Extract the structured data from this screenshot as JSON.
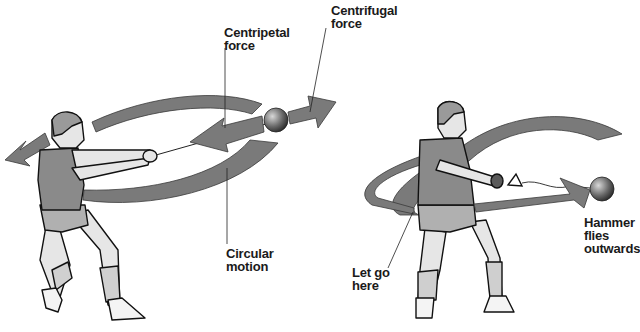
{
  "diagram": {
    "colors": {
      "arrow_fill": "#7a7a7a",
      "arrow_stroke": "#3a3a3a",
      "outline": "#111111",
      "shirt": "#8a8a8a",
      "shorts": "#b0b0b0",
      "skin": "#e6e6e6",
      "ball": "#6a6a6a"
    },
    "labels": {
      "centripetal": "Centripetal\nforce",
      "centrifugal": "Centrifugal\nforce",
      "circular_motion": "Circular\nmotion",
      "let_go": "Let go\nhere",
      "hammer_flies": "Hammer\nflies\noutwards"
    },
    "panels": [
      {
        "name": "spinning",
        "description": "Athlete spins holding hammer; arrows show circular motion, inward centripetal force and outward centrifugal force"
      },
      {
        "name": "release",
        "description": "Athlete releases hammer; hammer flies outwards along a tangent"
      }
    ]
  }
}
